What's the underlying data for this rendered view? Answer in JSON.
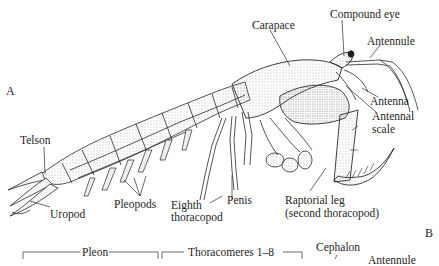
{
  "figure": {
    "panels": {
      "a": "A",
      "b": "B"
    },
    "panel_a_labels": {
      "carapace": "Carapace",
      "compound_eye": "Compound eye",
      "antennule": "Antennule",
      "antenna": "Antenna",
      "antennal_scale_line1": "Antennal",
      "antennal_scale_line2": "scale",
      "telson": "Telson",
      "uropod": "Uropod",
      "pleopods": "Pleopods",
      "eighth_thoracopod_line1": "Eighth",
      "eighth_thoracopod_line2": "thoracopod",
      "penis": "Penis",
      "raptorial_leg_line1": "Raptorial leg",
      "raptorial_leg_line2": "(second thoracopod)"
    },
    "panel_b_labels": {
      "pleon": "Pleon",
      "thoracomeres": "Thoracomeres 1–8",
      "cephalon": "Cephalon",
      "antennule": "Antennule"
    },
    "colors": {
      "ink": "#1e1e1e",
      "shade": "#9a9a9a",
      "background": "#ffffff"
    }
  }
}
